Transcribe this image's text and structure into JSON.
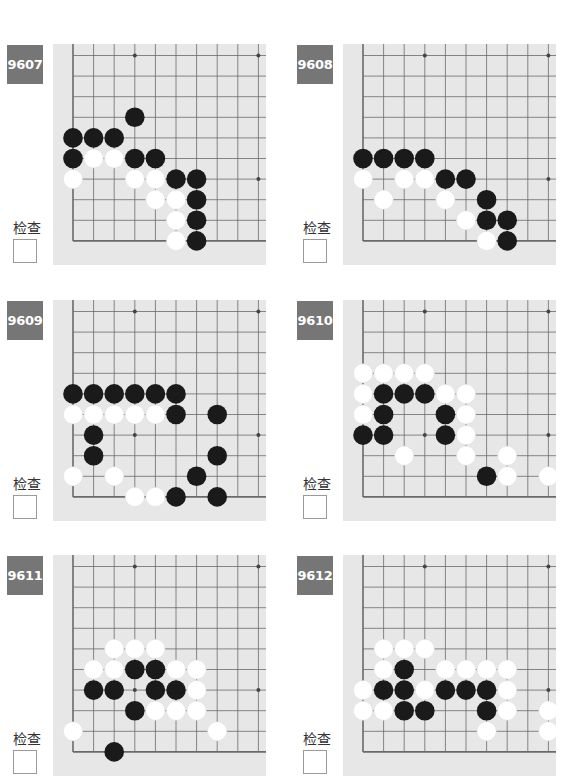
{
  "colors": {
    "board_bg": "#e7e7e7",
    "grid_line": "#6a6a6a",
    "label_bg": "#767676",
    "label_text": "#ffffff",
    "black_stone": "#1a1a1a",
    "white_stone": "#ffffff"
  },
  "check_label": "检查",
  "problems": [
    {
      "id": "9607",
      "check_label": "检查",
      "stars": [
        [
          3,
          0
        ],
        [
          9,
          0
        ],
        [
          9,
          6
        ]
      ],
      "black": [
        [
          3,
          3
        ],
        [
          0,
          4
        ],
        [
          1,
          4
        ],
        [
          2,
          4
        ],
        [
          0,
          5
        ],
        [
          3,
          5
        ],
        [
          4,
          5
        ],
        [
          5,
          6
        ],
        [
          6,
          6
        ],
        [
          6,
          7
        ],
        [
          6,
          8
        ],
        [
          6,
          9
        ]
      ],
      "white": [
        [
          1,
          5
        ],
        [
          2,
          5
        ],
        [
          0,
          6
        ],
        [
          3,
          6
        ],
        [
          4,
          6
        ],
        [
          4,
          7
        ],
        [
          5,
          7
        ],
        [
          5,
          8
        ],
        [
          5,
          9
        ]
      ]
    },
    {
      "id": "9608",
      "check_label": "检查",
      "stars": [
        [
          3,
          0
        ],
        [
          9,
          0
        ],
        [
          9,
          6
        ]
      ],
      "black": [
        [
          0,
          5
        ],
        [
          1,
          5
        ],
        [
          2,
          5
        ],
        [
          3,
          5
        ],
        [
          4,
          6
        ],
        [
          5,
          6
        ],
        [
          6,
          7
        ],
        [
          6,
          8
        ],
        [
          7,
          8
        ],
        [
          7,
          9
        ]
      ],
      "white": [
        [
          0,
          6
        ],
        [
          2,
          6
        ],
        [
          3,
          6
        ],
        [
          1,
          7
        ],
        [
          4,
          7
        ],
        [
          5,
          8
        ],
        [
          6,
          9
        ]
      ]
    },
    {
      "id": "9609",
      "check_label": "检查",
      "stars": [
        [
          3,
          0
        ],
        [
          9,
          0
        ],
        [
          3,
          6
        ],
        [
          9,
          6
        ]
      ],
      "black": [
        [
          0,
          4
        ],
        [
          1,
          4
        ],
        [
          2,
          4
        ],
        [
          3,
          4
        ],
        [
          4,
          4
        ],
        [
          5,
          4
        ],
        [
          5,
          5
        ],
        [
          7,
          5
        ],
        [
          1,
          6
        ],
        [
          1,
          7
        ],
        [
          7,
          7
        ],
        [
          6,
          8
        ],
        [
          5,
          9
        ],
        [
          7,
          9
        ]
      ],
      "white": [
        [
          0,
          5
        ],
        [
          1,
          5
        ],
        [
          2,
          5
        ],
        [
          3,
          5
        ],
        [
          4,
          5
        ],
        [
          0,
          8
        ],
        [
          2,
          8
        ],
        [
          3,
          9
        ],
        [
          4,
          9
        ]
      ]
    },
    {
      "id": "9610",
      "check_label": "检查",
      "stars": [
        [
          3,
          0
        ],
        [
          9,
          0
        ],
        [
          3,
          6
        ],
        [
          9,
          6
        ]
      ],
      "black": [
        [
          1,
          4
        ],
        [
          2,
          4
        ],
        [
          3,
          4
        ],
        [
          1,
          5
        ],
        [
          4,
          5
        ],
        [
          0,
          6
        ],
        [
          1,
          6
        ],
        [
          4,
          6
        ],
        [
          6,
          8
        ]
      ],
      "white": [
        [
          0,
          3
        ],
        [
          1,
          3
        ],
        [
          2,
          3
        ],
        [
          3,
          3
        ],
        [
          0,
          4
        ],
        [
          4,
          4
        ],
        [
          5,
          4
        ],
        [
          0,
          5
        ],
        [
          5,
          5
        ],
        [
          5,
          6
        ],
        [
          2,
          7
        ],
        [
          5,
          7
        ],
        [
          7,
          7
        ],
        [
          7,
          8
        ],
        [
          9,
          8
        ]
      ]
    },
    {
      "id": "9611",
      "check_label": "检查",
      "stars": [
        [
          3,
          0
        ],
        [
          9,
          0
        ],
        [
          3,
          6
        ],
        [
          9,
          6
        ]
      ],
      "black": [
        [
          3,
          5
        ],
        [
          4,
          5
        ],
        [
          1,
          6
        ],
        [
          2,
          6
        ],
        [
          4,
          6
        ],
        [
          5,
          6
        ],
        [
          3,
          7
        ],
        [
          2,
          9
        ]
      ],
      "white": [
        [
          2,
          4
        ],
        [
          3,
          4
        ],
        [
          4,
          4
        ],
        [
          1,
          5
        ],
        [
          2,
          5
        ],
        [
          5,
          5
        ],
        [
          6,
          5
        ],
        [
          6,
          6
        ],
        [
          4,
          7
        ],
        [
          5,
          7
        ],
        [
          6,
          7
        ],
        [
          0,
          8
        ],
        [
          7,
          8
        ]
      ]
    },
    {
      "id": "9612",
      "check_label": "检查",
      "stars": [
        [
          3,
          0
        ],
        [
          9,
          0
        ],
        [
          3,
          6
        ],
        [
          9,
          6
        ]
      ],
      "black": [
        [
          2,
          5
        ],
        [
          1,
          6
        ],
        [
          2,
          6
        ],
        [
          4,
          6
        ],
        [
          5,
          6
        ],
        [
          6,
          6
        ],
        [
          2,
          7
        ],
        [
          3,
          7
        ],
        [
          6,
          7
        ]
      ],
      "white": [
        [
          1,
          4
        ],
        [
          2,
          4
        ],
        [
          3,
          4
        ],
        [
          1,
          5
        ],
        [
          4,
          5
        ],
        [
          5,
          5
        ],
        [
          6,
          5
        ],
        [
          7,
          5
        ],
        [
          0,
          6
        ],
        [
          3,
          6
        ],
        [
          7,
          6
        ],
        [
          0,
          7
        ],
        [
          1,
          7
        ],
        [
          7,
          7
        ],
        [
          9,
          7
        ],
        [
          6,
          8
        ],
        [
          9,
          8
        ]
      ]
    }
  ]
}
